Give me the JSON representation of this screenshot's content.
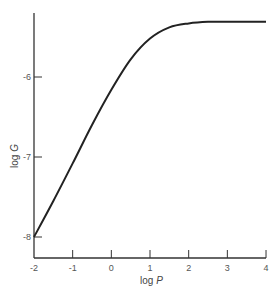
{
  "chart_data": {
    "type": "line",
    "title": "",
    "xlabel": "log P",
    "ylabel": "log G",
    "xlim": [
      -2,
      4
    ],
    "ylim": [
      -8.25,
      -5.1
    ],
    "x_ticks": [
      -2,
      -1,
      0,
      1,
      2,
      3,
      4
    ],
    "x_tick_labels": [
      "-2",
      "-1",
      "0",
      "1",
      "2",
      "3",
      "4"
    ],
    "y_ticks": [
      -8,
      -7,
      -6
    ],
    "y_tick_labels": [
      "-8",
      "-7",
      "-6"
    ],
    "grid": false,
    "legend": null,
    "series": [
      {
        "name": "log G vs log P",
        "x": [
          -2,
          -1.5,
          -1,
          -0.5,
          0,
          0.5,
          1,
          1.5,
          2,
          2.5,
          3,
          3.5,
          4
        ],
        "y": [
          -8.0,
          -7.55,
          -7.08,
          -6.6,
          -6.16,
          -5.78,
          -5.52,
          -5.38,
          -5.33,
          -5.31,
          -5.31,
          -5.31,
          -5.31
        ]
      }
    ]
  },
  "labels": {
    "x_axis": "log",
    "x_axis_var": "P",
    "y_axis": "log",
    "y_axis_var": "G"
  }
}
